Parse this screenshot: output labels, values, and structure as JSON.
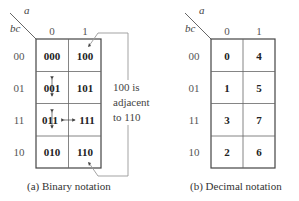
{
  "maps": [
    {
      "id": "binary",
      "col_var": "a",
      "row_var": "bc",
      "col_headers": [
        "0",
        "1"
      ],
      "row_headers": [
        "00",
        "01",
        "11",
        "10"
      ],
      "cells": [
        [
          "000",
          "100"
        ],
        [
          "001",
          "101"
        ],
        [
          "011",
          "111"
        ],
        [
          "010",
          "110"
        ]
      ],
      "caption": "(a) Binary notation"
    },
    {
      "id": "decimal",
      "col_var": "a",
      "row_var": "bc",
      "col_headers": [
        "0",
        "1"
      ],
      "row_headers": [
        "00",
        "01",
        "11",
        "10"
      ],
      "cells": [
        [
          "0",
          "4"
        ],
        [
          "1",
          "5"
        ],
        [
          "3",
          "7"
        ],
        [
          "2",
          "6"
        ]
      ],
      "caption": "(b) Decimal notation"
    }
  ],
  "annotation": {
    "line1": "100 is",
    "line2": "adjacent",
    "line3": "to 110"
  },
  "colors": {
    "grid": "#444444",
    "bracket": "#999999",
    "text": "#222222"
  }
}
